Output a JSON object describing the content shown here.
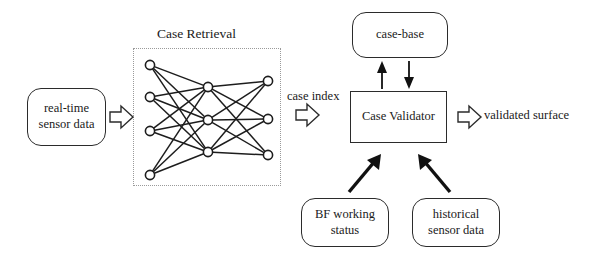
{
  "diagram": {
    "boxes": {
      "realtime_sensor": {
        "line1": "real-time",
        "line2": "sensor data"
      },
      "case_base": {
        "line1": "case-base"
      },
      "case_validator": {
        "line1": "Case Validator"
      },
      "bf_working": {
        "line1": "BF working",
        "line2": "status"
      },
      "historical_sensor": {
        "line1": "historical",
        "line2": "sensor data"
      }
    },
    "labels": {
      "case_retrieval": "Case Retrieval",
      "case_index": "case index",
      "validated_surface": "validated surface"
    },
    "icons": {
      "block_arrow_input": "block-arrow-right-icon",
      "block_arrow_index": "block-arrow-right-icon",
      "block_arrow_output": "block-arrow-right-icon",
      "arrow_up": "arrow-up-icon",
      "arrow_down": "arrow-down-icon",
      "arrow_up_right": "arrow-up-right-icon",
      "arrow_up_left": "arrow-up-left-icon"
    },
    "network": {
      "layers": [
        4,
        3,
        3
      ],
      "layer_names": [
        "input-layer",
        "hidden-layer",
        "output-layer"
      ],
      "node_radius": 4.6,
      "input_y": [
        65,
        97,
        131,
        175
      ],
      "hidden_y": [
        87,
        120,
        152
      ],
      "output_y": [
        81,
        119,
        155
      ],
      "input_x": 150,
      "hidden_x": 208,
      "output_x": 268
    },
    "colors": {
      "stroke": "#1d1d1d",
      "box_border": "#2b2b2b",
      "zone_border": "#9a9a9a",
      "background": "#ffffff",
      "text": "#1a1a1a"
    }
  }
}
